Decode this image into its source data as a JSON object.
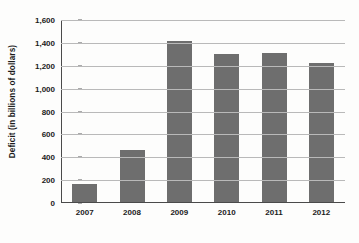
{
  "chart_data": {
    "type": "bar",
    "title": "",
    "subtitle": "",
    "xlabel": "",
    "ylabel": "Deficit (in billions of dollars)",
    "categories": [
      "2007",
      "2008",
      "2009",
      "2010",
      "2011",
      "2012"
    ],
    "values": [
      160,
      455,
      1410,
      1295,
      1300,
      1220
    ],
    "series": [
      {
        "name": "Deficit",
        "values": [
          160,
          455,
          1410,
          1295,
          1300,
          1220
        ]
      }
    ],
    "ylim": [
      0,
      1600
    ],
    "ytick_labels": [
      "0",
      "200",
      "400",
      "600",
      "800",
      "1,000",
      "1,200",
      "1,400",
      "1,600"
    ],
    "ytick_values": [
      0,
      200,
      400,
      600,
      800,
      1000,
      1200,
      1400,
      1600
    ],
    "grid": true,
    "legend": false,
    "legend_position": "none",
    "bar_color": "#6e6e6e",
    "gridline_color": "#b9b9b9",
    "axis_color": "#4a4a4a",
    "text_color": "#1b1b1b",
    "background_color": "#fdfdfc"
  }
}
